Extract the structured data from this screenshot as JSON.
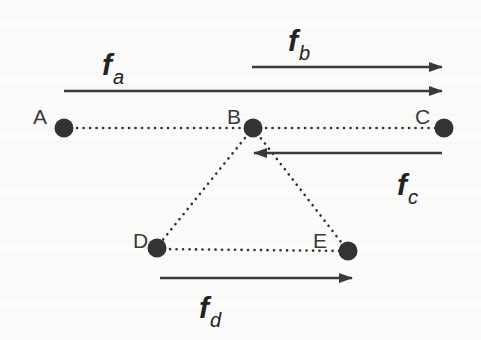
{
  "diagram": {
    "colors": {
      "background": "#fbfbfa",
      "node": "#333333",
      "arrow": "#3a3a3a",
      "dotted_edge": "#333333",
      "text": "#2a2a2a"
    },
    "nodes": [
      {
        "id": "A",
        "label": "A",
        "x": 64,
        "y": 128
      },
      {
        "id": "B",
        "label": "B",
        "x": 253,
        "y": 128
      },
      {
        "id": "C",
        "label": "C",
        "x": 444,
        "y": 128
      },
      {
        "id": "D",
        "label": "D",
        "x": 157,
        "y": 247
      },
      {
        "id": "E",
        "label": "E",
        "x": 348,
        "y": 251
      }
    ],
    "edges": [
      {
        "from": "A",
        "to": "B",
        "style": "dotted"
      },
      {
        "from": "B",
        "to": "C",
        "style": "dotted"
      },
      {
        "from": "B",
        "to": "D",
        "style": "dotted"
      },
      {
        "from": "B",
        "to": "E",
        "style": "dotted"
      },
      {
        "from": "D",
        "to": "E",
        "style": "dotted"
      }
    ],
    "flows": [
      {
        "id": "fa",
        "symbol": "f",
        "subscript": "a",
        "from": "A",
        "to": "C",
        "direction": "right"
      },
      {
        "id": "fb",
        "symbol": "f",
        "subscript": "b",
        "from": "B",
        "to": "C",
        "direction": "right"
      },
      {
        "id": "fc",
        "symbol": "f",
        "subscript": "c",
        "from": "C",
        "to": "B",
        "direction": "left"
      },
      {
        "id": "fd",
        "symbol": "f",
        "subscript": "d",
        "from": "D",
        "to": "E",
        "direction": "right"
      }
    ]
  }
}
